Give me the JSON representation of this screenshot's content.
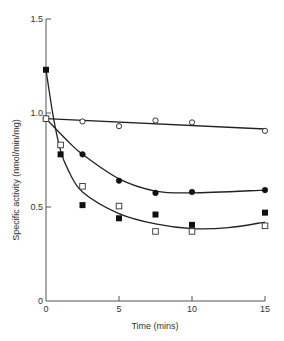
{
  "chart_data": {
    "type": "scatter",
    "title": "",
    "xlabel": "Time (mins)",
    "ylabel": "Specific activity (nmol/min/mg)",
    "xlim": [
      0,
      15
    ],
    "ylim": [
      0,
      1.5
    ],
    "xticks": [
      0,
      5,
      10,
      15
    ],
    "yticks": [
      0,
      0.5,
      1.0,
      1.5
    ],
    "xtick_labels": [
      "0",
      "5",
      "10",
      "15"
    ],
    "ytick_labels": [
      "0",
      "0.5",
      "1.0",
      "1.5"
    ],
    "grid": false,
    "legend": null,
    "series": [
      {
        "name": "open-circle",
        "marker": "open-circle",
        "x": [
          0,
          2.5,
          5,
          7.5,
          10,
          15
        ],
        "y": [
          0.97,
          0.955,
          0.93,
          0.96,
          0.95,
          0.905
        ],
        "fit_curve": [
          [
            0,
            0.97
          ],
          [
            15,
            0.915
          ]
        ]
      },
      {
        "name": "filled-circle",
        "marker": "filled-circle",
        "x": [
          0,
          2.5,
          5,
          7.5,
          10,
          15
        ],
        "y": [
          0.97,
          0.78,
          0.64,
          0.575,
          0.58,
          0.59
        ],
        "fit_curve": [
          [
            0,
            0.97
          ],
          [
            1.5,
            0.85
          ],
          [
            2.5,
            0.78
          ],
          [
            5,
            0.65
          ],
          [
            7.5,
            0.585
          ],
          [
            10,
            0.575
          ],
          [
            15,
            0.59
          ]
        ]
      },
      {
        "name": "filled-square",
        "marker": "filled-square",
        "x": [
          0,
          1,
          2.5,
          5,
          7.5,
          10,
          15
        ],
        "y": [
          1.23,
          0.78,
          0.51,
          0.44,
          0.46,
          0.405,
          0.47
        ],
        "fit_curve": null
      },
      {
        "name": "open-square",
        "marker": "open-square",
        "x": [
          0,
          1,
          2.5,
          5,
          7.5,
          10,
          15
        ],
        "y": [
          0.97,
          0.83,
          0.61,
          0.505,
          0.37,
          0.37,
          0.4
        ],
        "fit_curve": null
      }
    ],
    "fit_curves_extra": [
      {
        "name": "steep-decay-from-filled-square",
        "points": [
          [
            0,
            1.23
          ],
          [
            0.5,
            0.98
          ],
          [
            1,
            0.8
          ],
          [
            1.5,
            0.7
          ],
          [
            2.5,
            0.58
          ],
          [
            5,
            0.465
          ],
          [
            7.5,
            0.41
          ],
          [
            10,
            0.385
          ],
          [
            12.5,
            0.39
          ],
          [
            15,
            0.42
          ]
        ]
      }
    ]
  }
}
